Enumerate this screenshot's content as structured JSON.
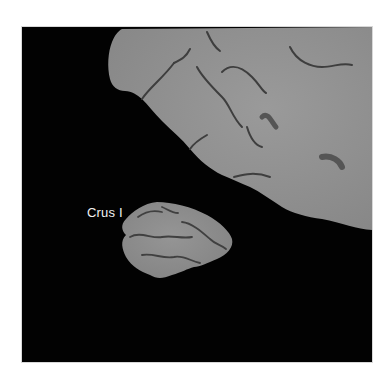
{
  "figure": {
    "annotations": [
      {
        "text": "Crus I",
        "target": "lower isolated lobule"
      }
    ],
    "colors": {
      "background": "#020202",
      "tissue": "#8e8e8e",
      "sulci": "#3a3a3a",
      "label": "#f2f2f2",
      "page": "#ffffff"
    }
  }
}
